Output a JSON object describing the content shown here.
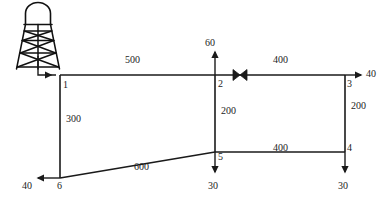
{
  "diagram": {
    "type": "pipe-network-schematic",
    "source": {
      "name": "elevated-water-tower",
      "icon": "water-tower-icon",
      "feeds_node": "1"
    },
    "nodes": [
      {
        "id": "1",
        "label": "1",
        "x": 60,
        "y": 75
      },
      {
        "id": "2",
        "label": "2",
        "x": 215,
        "y": 75
      },
      {
        "id": "3",
        "label": "3",
        "x": 345,
        "y": 75
      },
      {
        "id": "4",
        "label": "4",
        "x": 345,
        "y": 152
      },
      {
        "id": "5",
        "label": "5",
        "x": 215,
        "y": 152
      },
      {
        "id": "6",
        "label": "6",
        "x": 60,
        "y": 178
      }
    ],
    "pipes": [
      {
        "from": "1",
        "to": "2",
        "length": "500",
        "label_x": 135,
        "label_y": 60
      },
      {
        "from": "2",
        "to": "3",
        "length": "400",
        "label_x": 283,
        "label_y": 60
      },
      {
        "from": "1",
        "to": "6",
        "length": "300",
        "label_x": 69,
        "label_y": 119
      },
      {
        "from": "2",
        "to": "5",
        "length": "200",
        "label_x": 224,
        "label_y": 111
      },
      {
        "from": "3",
        "to": "4",
        "length": "200",
        "label_x": 354,
        "label_y": 106
      },
      {
        "from": "6",
        "to": "5",
        "length": "600",
        "label_x": 144,
        "label_y": 167
      },
      {
        "from": "5",
        "to": "4",
        "length": "400",
        "label_x": 283,
        "label_y": 148
      }
    ],
    "demands": [
      {
        "node": "2",
        "value": "60",
        "direction": "up",
        "label_x": 208,
        "label_y": 40
      },
      {
        "node": "3",
        "value": "40",
        "direction": "right",
        "label_x": 367,
        "label_y": 70
      },
      {
        "node": "4",
        "value": "30",
        "direction": "down",
        "label_x": 339,
        "label_y": 186
      },
      {
        "node": "5",
        "value": "30",
        "direction": "down",
        "label_x": 209,
        "label_y": 186
      },
      {
        "node": "6",
        "value": "40",
        "direction": "left",
        "label_x": 24,
        "label_y": 186
      }
    ],
    "valve": {
      "name": "gate-valve",
      "on_pipe": "2-3",
      "x": 240,
      "y": 75
    },
    "colors": {
      "line": "#1a1a1a",
      "text": "#1c1c1c",
      "background": "#ffffff"
    }
  }
}
